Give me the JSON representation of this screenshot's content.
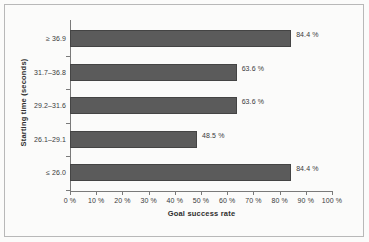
{
  "chart_data": {
    "type": "bar",
    "orientation": "horizontal",
    "title": "",
    "xlabel": "Goal success rate",
    "ylabel": "Starting time (seconds)",
    "categories": [
      "≥ 36.9",
      "31.7–36.8",
      "29.2–31.6",
      "26.1–29.1",
      "≤ 26.0"
    ],
    "values": [
      84.4,
      63.6,
      63.6,
      48.5,
      84.4
    ],
    "value_labels": [
      "84.4 %",
      "63.6 %",
      "63.6 %",
      "48.5 %",
      "84.4 %"
    ],
    "xlim": [
      0,
      100
    ],
    "xticks": [
      0,
      10,
      20,
      30,
      40,
      50,
      60,
      70,
      80,
      90,
      100
    ],
    "xtick_labels": [
      "0 %",
      "10 %",
      "20 %",
      "30 %",
      "40 %",
      "50 %",
      "60 %",
      "70 %",
      "80 %",
      "90 %",
      "100 %"
    ],
    "grid": false,
    "legend": false,
    "bar_color": "#5b5b5b",
    "bar_edge_color": "#444444",
    "axis_color": "#7a7a7a",
    "text_color": "#3a3a3a",
    "background": "#fbfbfa",
    "frame_color": "#b8b8b8"
  }
}
